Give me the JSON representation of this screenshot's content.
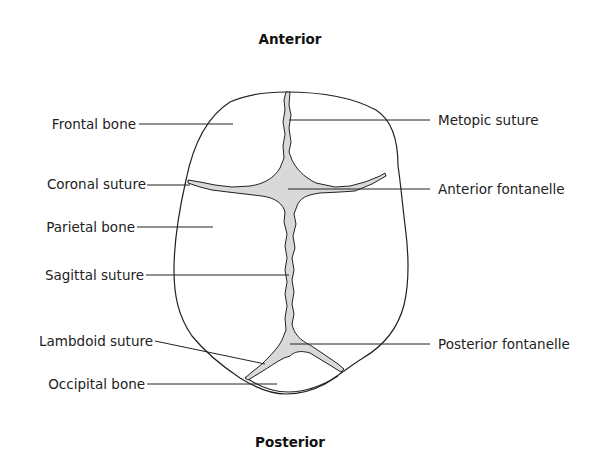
{
  "diagram": {
    "title_top": "Anterior",
    "title_bottom": "Posterior",
    "colors": {
      "outline": "#222222",
      "fontanelle_fill": "#d9d9d9",
      "leader_line": "#222222",
      "background": "#ffffff"
    },
    "labels_left": [
      {
        "id": "frontal-bone",
        "text": "Frontal bone"
      },
      {
        "id": "coronal-suture",
        "text": "Coronal suture"
      },
      {
        "id": "parietal-bone",
        "text": "Parietal bone"
      },
      {
        "id": "sagittal-suture",
        "text": "Sagittal suture"
      },
      {
        "id": "lambdoid-suture",
        "text": "Lambdoid suture"
      },
      {
        "id": "occipital-bone",
        "text": "Occipital bone"
      }
    ],
    "labels_right": [
      {
        "id": "metopic-suture",
        "text": "Metopic suture"
      },
      {
        "id": "anterior-fontanelle",
        "text": "Anterior fontanelle"
      },
      {
        "id": "posterior-fontanelle",
        "text": "Posterior fontanelle"
      }
    ]
  }
}
